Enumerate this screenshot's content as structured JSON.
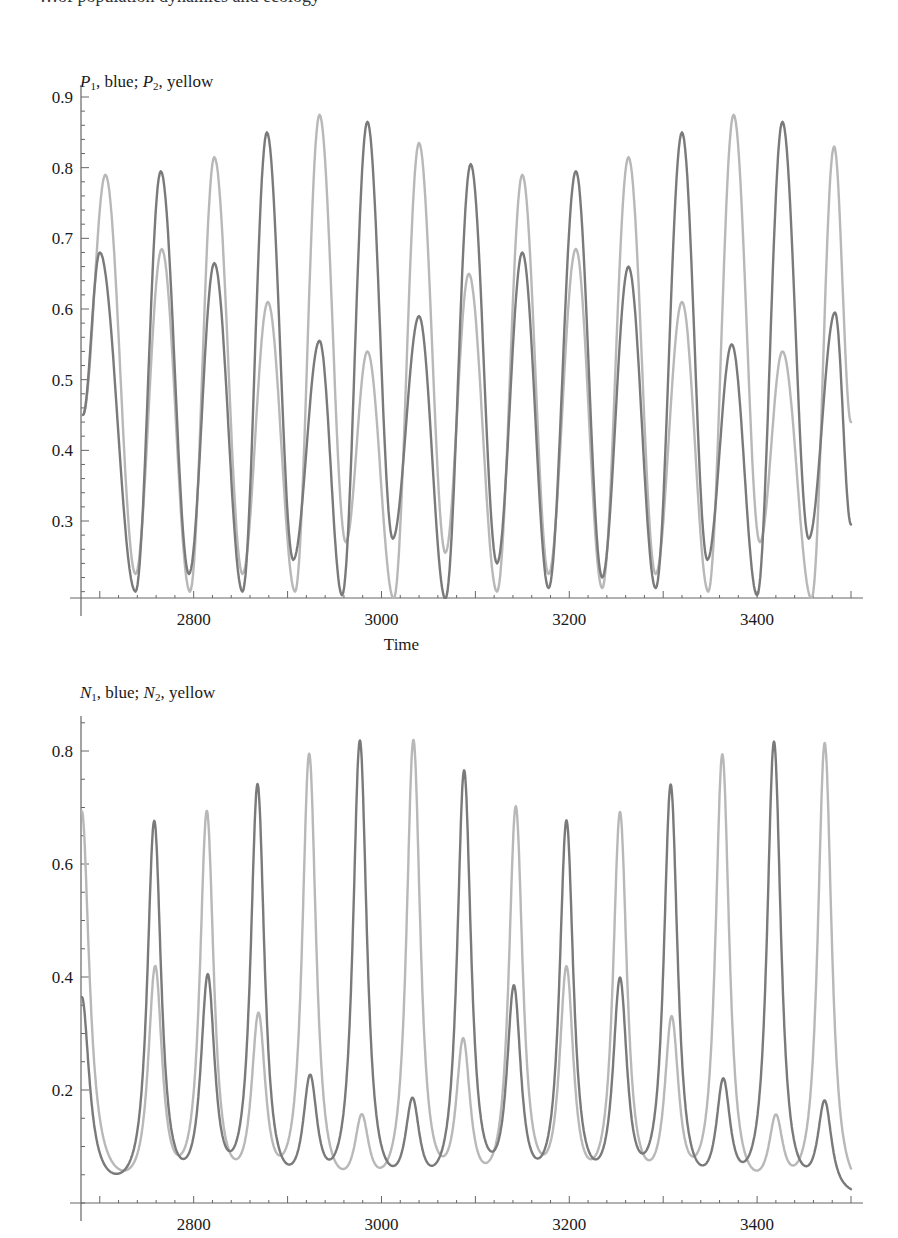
{
  "page": {
    "top_fragment": "…of population dynamics and ecology"
  },
  "charts": [
    {
      "id": "p-chart",
      "title_parts": {
        "var1": "P",
        "sub1": "1",
        "mid": ", blue; ",
        "var2": "P",
        "sub2": "2",
        "end": ", yellow"
      },
      "xlabel": "Time"
    },
    {
      "id": "n-chart",
      "title_parts": {
        "var1": "N",
        "sub1": "1",
        "mid": ", blue; ",
        "var2": "N",
        "sub2": "2",
        "end": ", yellow"
      },
      "xlabel": ""
    }
  ],
  "colors": {
    "series1": "#7a7a7a",
    "series2": "#b8b8b8",
    "axis": "#666666",
    "text": "#1a1a1a"
  },
  "chart_data": [
    {
      "type": "line",
      "title": "P1, blue; P2, yellow",
      "xlabel": "Time",
      "ylabel": "",
      "xlim": [
        2680,
        3500
      ],
      "ylim": [
        0.19,
        0.92
      ],
      "xticks": [
        2800,
        3000,
        3200,
        3400
      ],
      "yticks": [
        0.3,
        0.4,
        0.5,
        0.6,
        0.7,
        0.8,
        0.9
      ],
      "grid": false,
      "legend": "in title",
      "series": [
        {
          "name": "P1 (blue)",
          "peaks": [
            {
              "t": 2700,
              "v": 0.68
            },
            {
              "t": 2765,
              "v": 0.795
            },
            {
              "t": 2822,
              "v": 0.665
            },
            {
              "t": 2878,
              "v": 0.85
            },
            {
              "t": 2934,
              "v": 0.555
            },
            {
              "t": 2985,
              "v": 0.865
            },
            {
              "t": 3040,
              "v": 0.59
            },
            {
              "t": 3095,
              "v": 0.805
            },
            {
              "t": 3150,
              "v": 0.68
            },
            {
              "t": 3207,
              "v": 0.795
            },
            {
              "t": 3263,
              "v": 0.66
            },
            {
              "t": 3320,
              "v": 0.85
            },
            {
              "t": 3373,
              "v": 0.55
            },
            {
              "t": 3427,
              "v": 0.865
            },
            {
              "t": 3483,
              "v": 0.595
            }
          ],
          "troughs": [
            {
              "t": 2738,
              "v": 0.2
            },
            {
              "t": 2795,
              "v": 0.225
            },
            {
              "t": 2852,
              "v": 0.2
            },
            {
              "t": 2906,
              "v": 0.245
            },
            {
              "t": 2958,
              "v": 0.195
            },
            {
              "t": 3012,
              "v": 0.275
            },
            {
              "t": 3068,
              "v": 0.19
            },
            {
              "t": 3123,
              "v": 0.24
            },
            {
              "t": 3178,
              "v": 0.205
            },
            {
              "t": 3235,
              "v": 0.22
            },
            {
              "t": 3292,
              "v": 0.205
            },
            {
              "t": 3347,
              "v": 0.245
            },
            {
              "t": 3400,
              "v": 0.195
            },
            {
              "t": 3455,
              "v": 0.275
            }
          ],
          "end": {
            "t": 3500,
            "v": 0.295
          }
        },
        {
          "name": "P2 (yellow)",
          "peaks": [
            {
              "t": 2706,
              "v": 0.79
            },
            {
              "t": 2766,
              "v": 0.685
            },
            {
              "t": 2822,
              "v": 0.815
            },
            {
              "t": 2879,
              "v": 0.61
            },
            {
              "t": 2934,
              "v": 0.875
            },
            {
              "t": 2985,
              "v": 0.54
            },
            {
              "t": 3040,
              "v": 0.835
            },
            {
              "t": 3093,
              "v": 0.65
            },
            {
              "t": 3150,
              "v": 0.79
            },
            {
              "t": 3207,
              "v": 0.685
            },
            {
              "t": 3263,
              "v": 0.815
            },
            {
              "t": 3320,
              "v": 0.61
            },
            {
              "t": 3375,
              "v": 0.875
            },
            {
              "t": 3427,
              "v": 0.54
            },
            {
              "t": 3482,
              "v": 0.83
            }
          ],
          "troughs": [
            {
              "t": 2738,
              "v": 0.225
            },
            {
              "t": 2796,
              "v": 0.2
            },
            {
              "t": 2852,
              "v": 0.225
            },
            {
              "t": 2908,
              "v": 0.2
            },
            {
              "t": 2962,
              "v": 0.27
            },
            {
              "t": 3013,
              "v": 0.19
            },
            {
              "t": 3068,
              "v": 0.255
            },
            {
              "t": 3123,
              "v": 0.2
            },
            {
              "t": 3178,
              "v": 0.225
            },
            {
              "t": 3235,
              "v": 0.205
            },
            {
              "t": 3292,
              "v": 0.225
            },
            {
              "t": 3348,
              "v": 0.2
            },
            {
              "t": 3403,
              "v": 0.27
            },
            {
              "t": 3458,
              "v": 0.19
            }
          ],
          "end": {
            "t": 3500,
            "v": 0.44
          }
        }
      ]
    },
    {
      "type": "line",
      "title": "N1, blue; N2, yellow",
      "xlabel": "",
      "ylabel": "",
      "xlim": [
        2680,
        3500
      ],
      "ylim": [
        0.0,
        0.85
      ],
      "xticks": [
        2800,
        3000,
        3200,
        3400
      ],
      "yticks": [
        0.2,
        0.4,
        0.6,
        0.8
      ],
      "grid": false,
      "legend": "in title",
      "series": [
        {
          "name": "N1 (blue)",
          "start": {
            "t": 2681,
            "v": 0.36
          },
          "peaks": [
            {
              "t": 2758,
              "v": 0.665
            },
            {
              "t": 2815,
              "v": 0.385
            },
            {
              "t": 2868,
              "v": 0.73
            },
            {
              "t": 2924,
              "v": 0.205
            },
            {
              "t": 2977,
              "v": 0.81
            },
            {
              "t": 3033,
              "v": 0.165
            },
            {
              "t": 3088,
              "v": 0.755
            },
            {
              "t": 3141,
              "v": 0.365
            },
            {
              "t": 3197,
              "v": 0.665
            },
            {
              "t": 3254,
              "v": 0.38
            },
            {
              "t": 3308,
              "v": 0.73
            },
            {
              "t": 3364,
              "v": 0.2
            },
            {
              "t": 3418,
              "v": 0.81
            },
            {
              "t": 3472,
              "v": 0.17
            }
          ],
          "baseline": 0.01
        },
        {
          "name": "N2 (yellow)",
          "start": {
            "t": 2681,
            "v": 0.69
          },
          "peaks": [
            {
              "t": 2759,
              "v": 0.4
            },
            {
              "t": 2814,
              "v": 0.68
            },
            {
              "t": 2869,
              "v": 0.315
            },
            {
              "t": 2923,
              "v": 0.785
            },
            {
              "t": 2979,
              "v": 0.135
            },
            {
              "t": 3034,
              "v": 0.81
            },
            {
              "t": 3087,
              "v": 0.27
            },
            {
              "t": 3143,
              "v": 0.69
            },
            {
              "t": 3197,
              "v": 0.4
            },
            {
              "t": 3254,
              "v": 0.68
            },
            {
              "t": 3309,
              "v": 0.31
            },
            {
              "t": 3363,
              "v": 0.785
            },
            {
              "t": 3420,
              "v": 0.135
            },
            {
              "t": 3472,
              "v": 0.81
            }
          ],
          "baseline": 0.008
        }
      ]
    }
  ]
}
